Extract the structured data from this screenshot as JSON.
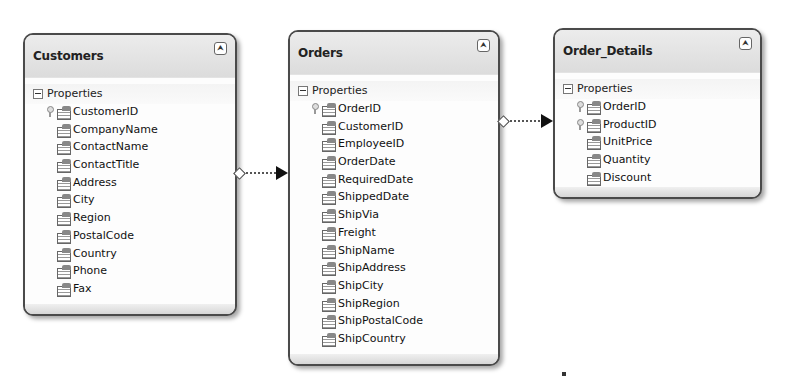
{
  "entities": [
    {
      "name": "Customers",
      "section": "Properties",
      "properties": [
        {
          "label": "CustomerID",
          "key": true
        },
        {
          "label": "CompanyName",
          "key": false
        },
        {
          "label": "ContactName",
          "key": false
        },
        {
          "label": "ContactTitle",
          "key": false
        },
        {
          "label": "Address",
          "key": false
        },
        {
          "label": "City",
          "key": false
        },
        {
          "label": "Region",
          "key": false
        },
        {
          "label": "PostalCode",
          "key": false
        },
        {
          "label": "Country",
          "key": false
        },
        {
          "label": "Phone",
          "key": false
        },
        {
          "label": "Fax",
          "key": false
        }
      ]
    },
    {
      "name": "Orders",
      "section": "Properties",
      "properties": [
        {
          "label": "OrderID",
          "key": true
        },
        {
          "label": "CustomerID",
          "key": false
        },
        {
          "label": "EmployeeID",
          "key": false
        },
        {
          "label": "OrderDate",
          "key": false
        },
        {
          "label": "RequiredDate",
          "key": false
        },
        {
          "label": "ShippedDate",
          "key": false
        },
        {
          "label": "ShipVia",
          "key": false
        },
        {
          "label": "Freight",
          "key": false
        },
        {
          "label": "ShipName",
          "key": false
        },
        {
          "label": "ShipAddress",
          "key": false
        },
        {
          "label": "ShipCity",
          "key": false
        },
        {
          "label": "ShipRegion",
          "key": false
        },
        {
          "label": "ShipPostalCode",
          "key": false
        },
        {
          "label": "ShipCountry",
          "key": false
        }
      ]
    },
    {
      "name": "Order_Details",
      "section": "Properties",
      "properties": [
        {
          "label": "OrderID",
          "key": true
        },
        {
          "label": "ProductID",
          "key": true
        },
        {
          "label": "UnitPrice",
          "key": false
        },
        {
          "label": "Quantity",
          "key": false
        },
        {
          "label": "Discount",
          "key": false
        }
      ]
    }
  ],
  "relationships": [
    {
      "from": "Customers",
      "to": "Orders"
    },
    {
      "from": "Orders",
      "to": "Order_Details"
    }
  ],
  "icons": {
    "collapse": "⮝",
    "key": "key-icon",
    "property": "property-icon",
    "section_toggle": "minus-box-icon"
  }
}
